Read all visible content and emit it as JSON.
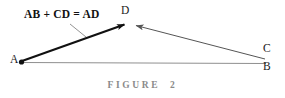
{
  "figure": {
    "caption": "FIGURE  2",
    "equation_label": "AB + CD = AD",
    "background_color": "#ffffff",
    "vertices": [
      {
        "name": "A",
        "label": "A",
        "x": 21,
        "y": 62,
        "marker": "dot"
      },
      {
        "name": "D",
        "label": "D",
        "x": 127,
        "y": 23,
        "marker": "none"
      },
      {
        "name": "C",
        "label": "C",
        "x": 266,
        "y": 62,
        "marker": "none"
      },
      {
        "name": "B",
        "label": "B",
        "x": 266,
        "y": 62,
        "marker": "none"
      }
    ],
    "segments": [
      {
        "name": "vector-a-to-d",
        "from": "A",
        "to": "D",
        "arrow": "end",
        "color": "#111111",
        "width": 2.2,
        "description": "thick black arrow from A to D"
      },
      {
        "name": "vector-c-to-d",
        "from": "C",
        "to": "D",
        "arrow": "end",
        "color": "#555555",
        "width": 1.0,
        "description": "thin gray arrow from C to D"
      },
      {
        "name": "baseline-a-to-b",
        "from": "A",
        "to": "B",
        "arrow": "none",
        "color": "#8f8f8f",
        "width": 1.0,
        "description": "thin gray horizontal baseline from A to B"
      }
    ],
    "leader_line": {
      "name": "equation-leader-line",
      "from_x": 70,
      "from_y": 24,
      "to_x": 86,
      "to_y": 37,
      "color": "#777777",
      "width": 0.8
    }
  }
}
